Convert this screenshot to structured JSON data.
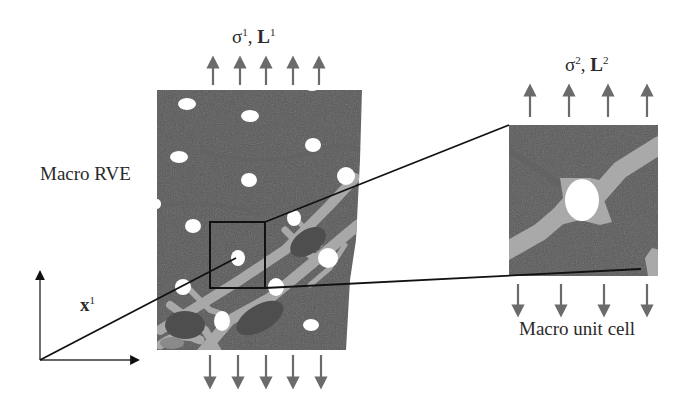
{
  "figure": {
    "labels": {
      "top_left_load": {
        "sigma": "σ",
        "sigma_sup": "1",
        "sep": ", ",
        "L": "L",
        "L_sup": "1"
      },
      "top_right_load": {
        "sigma": "σ",
        "sigma_sup": "2",
        "sep": ", ",
        "L": "L",
        "L_sup": "2"
      },
      "macro_rve": "Macro RVE",
      "macro_unit_cell": "Macro unit cell",
      "position_vector": {
        "x": "x",
        "x_sup": "1"
      }
    },
    "colors": {
      "matrix": "#5a5a5a",
      "matrix_dark": "#4d4d4d",
      "band": "#a9a9a9",
      "pores": "#ffffff",
      "arrows": "#6b6b6b",
      "lines": "#111111",
      "text": "#2a2a2a"
    },
    "arrows": {
      "rve_top_count": 5,
      "rve_bottom_count": 5,
      "cell_top_count": 4,
      "cell_bottom_count": 4
    }
  }
}
